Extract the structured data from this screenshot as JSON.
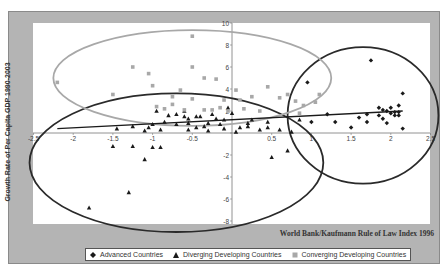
{
  "chart_data": {
    "type": "scatter",
    "title": "",
    "xlabel": "World Bank/Kaufmann Rule of Law Index 1996",
    "ylabel": "Growth Rate of Per Capita GDP 1990-2003",
    "xlim": [
      -2.5,
      2.5
    ],
    "ylim": [
      -8,
      10
    ],
    "x_ticks": [
      "-2.5",
      "-2",
      "-1.5",
      "-1",
      "-0.5",
      "0.5",
      "1",
      "1.5",
      "2",
      "2.5"
    ],
    "y_ticks": [
      "10",
      "8",
      "6",
      "4",
      "2",
      "0",
      "-2",
      "-4",
      "-6",
      "-8"
    ],
    "grid": false,
    "legend_position": "bottom",
    "legend": [
      "Advanced Countries",
      "Diverging Developing Countries",
      "Converging Developing Countries"
    ],
    "series": [
      {
        "name": "Advanced Countries",
        "marker": "diamond",
        "color": "#1a1a1a",
        "points": [
          [
            0.95,
            4.6
          ],
          [
            1.6,
            1.4
          ],
          [
            1.2,
            1.7
          ],
          [
            1.7,
            1.7
          ],
          [
            1.75,
            6.6
          ],
          [
            1.85,
            2.3
          ],
          [
            1.9,
            2.1
          ],
          [
            1.95,
            2.0
          ],
          [
            2.0,
            2.3
          ],
          [
            2.05,
            1.9
          ],
          [
            2.1,
            2.5
          ],
          [
            2.1,
            1.6
          ],
          [
            2.15,
            3.6
          ],
          [
            2.0,
            1.8
          ],
          [
            1.85,
            1.6
          ],
          [
            2.05,
            1.6
          ],
          [
            1.9,
            1.3
          ],
          [
            1.5,
            0.5
          ],
          [
            1.0,
            1.0
          ],
          [
            1.3,
            1.0
          ],
          [
            2.15,
            0.4
          ],
          [
            1.7,
            1.0
          ],
          [
            1.95,
            0.9
          ],
          [
            2.1,
            1.9
          ]
        ]
      },
      {
        "name": "Diverging Developing Countries",
        "marker": "triangle",
        "color": "#1a1a1a",
        "points": [
          [
            -1.8,
            -6.8
          ],
          [
            -1.3,
            -5.4
          ],
          [
            -1.1,
            -2.4
          ],
          [
            -1.5,
            -1.2
          ],
          [
            -1.0,
            -1.3
          ],
          [
            -1.25,
            -1.2
          ],
          [
            -0.9,
            -1.3
          ],
          [
            -1.1,
            0.2
          ],
          [
            -1.05,
            0.5
          ],
          [
            -1.45,
            0.4
          ],
          [
            -1.25,
            0.6
          ],
          [
            -0.7,
            0.8
          ],
          [
            -0.55,
            0.3
          ],
          [
            -0.55,
            0.9
          ],
          [
            -0.45,
            0.5
          ],
          [
            -0.35,
            0.6
          ],
          [
            -0.6,
            1.5
          ],
          [
            -0.55,
            1.3
          ],
          [
            -0.8,
            1.6
          ],
          [
            -0.7,
            1.7
          ],
          [
            -0.4,
            1.5
          ],
          [
            -0.2,
            1.3
          ],
          [
            -0.1,
            1.2
          ],
          [
            -0.15,
            0.8
          ],
          [
            -0.3,
            0.9
          ],
          [
            -0.45,
            1.5
          ],
          [
            -0.25,
            1.7
          ],
          [
            0.0,
            1.8
          ],
          [
            -0.95,
            2.0
          ],
          [
            -0.6,
            2.0
          ],
          [
            -0.05,
            2.3
          ],
          [
            0.2,
            0.6
          ],
          [
            0.35,
            0.3
          ],
          [
            0.45,
            0.5
          ],
          [
            0.6,
            0.3
          ],
          [
            0.25,
            1.2
          ],
          [
            0.2,
            0.9
          ],
          [
            0.45,
            1.0
          ],
          [
            0.1,
            0.5
          ],
          [
            0.5,
            -2.2
          ],
          [
            0.7,
            -1.6
          ],
          [
            0.75,
            0.1
          ],
          [
            0.85,
            1.2
          ],
          [
            -0.85,
            1.0
          ],
          [
            -1.0,
            0.8
          ],
          [
            -0.9,
            0.3
          ],
          [
            -0.3,
            0.2
          ],
          [
            -0.1,
            0.4
          ],
          [
            0.05,
            0.1
          ]
        ]
      },
      {
        "name": "Converging Developing Countries",
        "marker": "square",
        "color": "#a8a8a8",
        "points": [
          [
            -2.2,
            4.6
          ],
          [
            -1.25,
            6.0
          ],
          [
            -1.0,
            4.3
          ],
          [
            -1.05,
            5.4
          ],
          [
            -0.5,
            8.8
          ],
          [
            -0.5,
            6.0
          ],
          [
            -0.2,
            4.9
          ],
          [
            -0.35,
            5.0
          ],
          [
            -0.65,
            3.9
          ],
          [
            -1.5,
            3.5
          ],
          [
            -0.85,
            2.2
          ],
          [
            -0.95,
            2.4
          ],
          [
            -0.75,
            3.3
          ],
          [
            -0.5,
            3.1
          ],
          [
            -0.35,
            2.1
          ],
          [
            -0.25,
            2.1
          ],
          [
            -0.1,
            3.0
          ],
          [
            -0.05,
            2.0
          ],
          [
            0.05,
            3.9
          ],
          [
            0.1,
            3.0
          ],
          [
            0.25,
            3.3
          ],
          [
            0.35,
            2.0
          ],
          [
            0.45,
            4.2
          ],
          [
            0.6,
            3.2
          ],
          [
            0.7,
            3.5
          ],
          [
            0.8,
            2.9
          ],
          [
            0.85,
            1.8
          ],
          [
            0.9,
            2.5
          ],
          [
            1.1,
            3.5
          ],
          [
            1.05,
            2.8
          ],
          [
            -0.6,
            2.1
          ],
          [
            -0.15,
            2.3
          ],
          [
            0.15,
            2.2
          ],
          [
            -0.75,
            2.6
          ]
        ]
      }
    ],
    "trendline": {
      "from": [
        -2.2,
        0.4
      ],
      "to": [
        2.15,
        2.0
      ],
      "color": "#1a1a1a"
    },
    "annotations": [
      {
        "type": "ellipse",
        "label": "Advanced",
        "cx": 1.65,
        "cy": 1.6,
        "rx": 0.95,
        "ry": 6.2,
        "color": "#2a2a2a"
      },
      {
        "type": "ellipse",
        "label": "Diverging",
        "cx": -0.7,
        "cy": -2.7,
        "rx": 1.85,
        "ry": 6.3,
        "color": "#2a2a2a"
      },
      {
        "type": "ellipse",
        "label": "Converging",
        "cx": -0.5,
        "cy": 5.0,
        "rx": 1.75,
        "ry": 4.35,
        "color": "#a8a8a8"
      }
    ]
  }
}
